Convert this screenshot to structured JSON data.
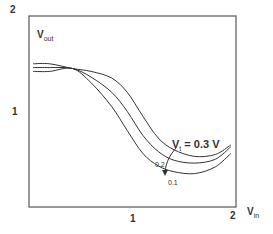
{
  "chart_data": {
    "type": "line",
    "title": "",
    "xlabel": "V_in",
    "ylabel": "V_out",
    "xlim": [
      0,
      2
    ],
    "ylim": [
      0,
      2
    ],
    "x_ticks": [
      "1",
      "2"
    ],
    "y_ticks": [
      "1",
      "2"
    ],
    "grid": false,
    "legend": "none (curves labeled inline)",
    "annotation": "V_t = 0.3 V",
    "series": [
      {
        "name": "V_t = 0.3 V",
        "x": [
          0.04,
          0.2,
          0.42,
          0.6,
          0.8,
          0.95,
          1.1,
          1.25,
          1.4,
          1.6,
          1.8,
          1.95
        ],
        "y": [
          1.5,
          1.5,
          1.45,
          1.42,
          1.35,
          1.2,
          0.95,
          0.72,
          0.6,
          0.53,
          0.55,
          0.65
        ]
      },
      {
        "name": "0.2",
        "x": [
          0.04,
          0.2,
          0.42,
          0.6,
          0.8,
          0.95,
          1.1,
          1.25,
          1.4,
          1.6,
          1.8,
          1.95
        ],
        "y": [
          1.46,
          1.46,
          1.45,
          1.36,
          1.2,
          1.0,
          0.75,
          0.58,
          0.49,
          0.46,
          0.5,
          0.63
        ]
      },
      {
        "name": "0.1",
        "x": [
          0.04,
          0.2,
          0.42,
          0.6,
          0.8,
          0.95,
          1.1,
          1.25,
          1.4,
          1.6,
          1.8,
          1.95
        ],
        "y": [
          1.42,
          1.42,
          1.45,
          1.3,
          1.05,
          0.8,
          0.56,
          0.43,
          0.37,
          0.35,
          0.42,
          0.56
        ]
      }
    ]
  },
  "labels": {
    "y_top": "2",
    "y_mid": "1",
    "x_mid": "1",
    "x_end": "2",
    "ylabel_main": "V",
    "ylabel_sub": "out",
    "xlabel_main": "V",
    "xlabel_sub": "in",
    "ann_main": "V",
    "ann_sub": "t",
    "ann_rest": " = 0.3 V",
    "curve_02": "0.2",
    "curve_01": "0.1"
  }
}
